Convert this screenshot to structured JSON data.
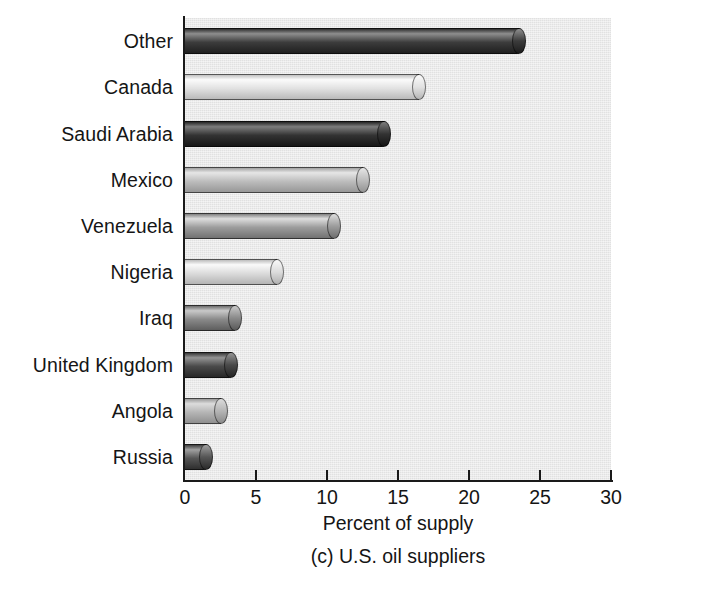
{
  "chart_data": {
    "type": "bar",
    "orientation": "horizontal",
    "title": "",
    "caption": "(c) U.S. oil suppliers",
    "xlabel": "Percent of supply",
    "ylabel": "",
    "xlim": [
      0,
      30
    ],
    "xticks": [
      0,
      5,
      10,
      15,
      20,
      25,
      30
    ],
    "xtick_labels": [
      "0",
      "5",
      "10",
      "15",
      "20",
      "25",
      "30"
    ],
    "grid": false,
    "legend": "none",
    "categories": [
      "Other",
      "Canada",
      "Saudi Arabia",
      "Mexico",
      "Venezuela",
      "Nigeria",
      "Iraq",
      "United Kingdom",
      "Angola",
      "Russia"
    ],
    "values": [
      24,
      17,
      14.5,
      13,
      11,
      7,
      4,
      3.7,
      3,
      2
    ],
    "bars": [
      {
        "label": "Other",
        "value": 24,
        "shade": "#3c3c3c",
        "shade_light": "#8e8e8e",
        "shade_dark": "#1d1d1d"
      },
      {
        "label": "Canada",
        "value": 17,
        "shade": "#e2e2e2",
        "shade_light": "#fbfbfb",
        "shade_dark": "#b6b6b6"
      },
      {
        "label": "Saudi Arabia",
        "value": 14.5,
        "shade": "#333333",
        "shade_light": "#7d7d7d",
        "shade_dark": "#151515"
      },
      {
        "label": "Mexico",
        "value": 13,
        "shade": "#bdbdbd",
        "shade_light": "#e6e6e6",
        "shade_dark": "#949494"
      },
      {
        "label": "Venezuela",
        "value": 11,
        "shade": "#9d9d9d",
        "shade_light": "#dedede",
        "shade_dark": "#6e6e6e"
      },
      {
        "label": "Nigeria",
        "value": 7,
        "shade": "#dcdcdc",
        "shade_light": "#fafafa",
        "shade_dark": "#b0b0b0"
      },
      {
        "label": "Iraq",
        "value": 4,
        "shade": "#8a8a8a",
        "shade_light": "#c9c9c9",
        "shade_dark": "#5a5a5a"
      },
      {
        "label": "United Kingdom",
        "value": 3.7,
        "shade": "#4a4a4a",
        "shade_light": "#949494",
        "shade_dark": "#262626"
      },
      {
        "label": "Angola",
        "value": 3,
        "shade": "#b5b5b5",
        "shade_light": "#dcdcdc",
        "shade_dark": "#8c8c8c"
      },
      {
        "label": "Russia",
        "value": 2,
        "shade": "#565656",
        "shade_light": "#a0a0a0",
        "shade_dark": "#2b2b2b"
      }
    ],
    "plot_background": "#e9e9e9",
    "axis_color": "#1a1a1a",
    "text_color": "#151515"
  }
}
